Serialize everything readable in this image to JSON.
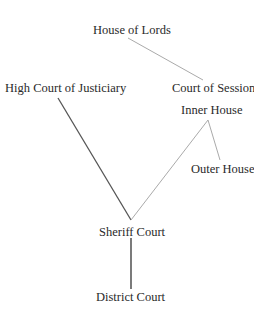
{
  "diagram": {
    "type": "hierarchy",
    "title": "",
    "nodes": [
      {
        "id": "lords",
        "label": "House of Lords",
        "x": 93,
        "y": 24
      },
      {
        "id": "justiciary",
        "label": "High Court of Justiciary",
        "x": 5,
        "y": 82
      },
      {
        "id": "session",
        "label": "Court of Session",
        "x": 172,
        "y": 82
      },
      {
        "id": "inner",
        "label": "Inner House",
        "x": 181,
        "y": 104
      },
      {
        "id": "outer",
        "label": "Outer House",
        "x": 191,
        "y": 163
      },
      {
        "id": "sheriff",
        "label": "Sheriff Court",
        "x": 99,
        "y": 226
      },
      {
        "id": "district",
        "label": "District Court",
        "x": 96,
        "y": 291
      }
    ],
    "edges": [
      {
        "from": "lords",
        "to": "session",
        "x1": 128,
        "y1": 38,
        "x2": 203,
        "y2": 80,
        "color": "#aaaaaa",
        "width": 1
      },
      {
        "from": "justiciary",
        "to": "sheriff",
        "x1": 58,
        "y1": 98,
        "x2": 131,
        "y2": 220,
        "color": "#555555",
        "width": 1.3
      },
      {
        "from": "inner",
        "to": "sheriff",
        "x1": 208,
        "y1": 120,
        "x2": 131,
        "y2": 220,
        "color": "#aaaaaa",
        "width": 1
      },
      {
        "from": "inner",
        "to": "outer",
        "x1": 208,
        "y1": 120,
        "x2": 220,
        "y2": 160,
        "color": "#aaaaaa",
        "width": 1
      },
      {
        "from": "sheriff",
        "to": "district",
        "x1": 131,
        "y1": 238,
        "x2": 131,
        "y2": 289,
        "color": "#333333",
        "width": 1.3
      }
    ]
  }
}
